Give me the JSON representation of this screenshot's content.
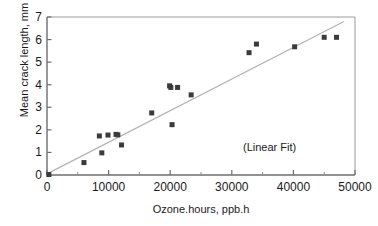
{
  "chart_data": {
    "type": "scatter",
    "title": "",
    "xlabel": "Ozone.hours, ppb.h",
    "ylabel": "Mean crack length, mm",
    "xlim": [
      0,
      50000
    ],
    "ylim": [
      0,
      7
    ],
    "xticks": [
      0,
      10000,
      20000,
      30000,
      40000,
      50000
    ],
    "xtick_labels": [
      "0",
      "10000",
      "20000",
      "30000",
      "40000",
      "50000"
    ],
    "xminor_ticks": [
      5000,
      15000,
      25000,
      35000,
      45000
    ],
    "yticks": [
      0,
      1,
      2,
      3,
      4,
      5,
      6,
      7
    ],
    "ytick_labels": [
      "0",
      "1",
      "2",
      "3",
      "4",
      "5",
      "6",
      "7"
    ],
    "grid": false,
    "legend": false,
    "annotations": [
      {
        "text": "(Linear Fit)",
        "x": 32000,
        "y": 1.35
      }
    ],
    "marker": {
      "shape": "square",
      "color": "#3b3b3b",
      "size": 5
    },
    "series": [
      {
        "name": "Mean crack length",
        "type": "scatter",
        "points": [
          {
            "x": 300,
            "y": 0.02
          },
          {
            "x": 6000,
            "y": 0.55
          },
          {
            "x": 8500,
            "y": 1.73
          },
          {
            "x": 8900,
            "y": 0.98
          },
          {
            "x": 9900,
            "y": 1.77
          },
          {
            "x": 11200,
            "y": 1.8
          },
          {
            "x": 11500,
            "y": 1.78
          },
          {
            "x": 12100,
            "y": 1.33
          },
          {
            "x": 17000,
            "y": 2.75
          },
          {
            "x": 19900,
            "y": 3.95
          },
          {
            "x": 20100,
            "y": 3.88
          },
          {
            "x": 20300,
            "y": 2.23
          },
          {
            "x": 21200,
            "y": 3.88
          },
          {
            "x": 23400,
            "y": 3.55
          },
          {
            "x": 32800,
            "y": 5.42
          },
          {
            "x": 34000,
            "y": 5.8
          },
          {
            "x": 40200,
            "y": 5.68
          },
          {
            "x": 45000,
            "y": 6.1
          },
          {
            "x": 47000,
            "y": 6.1
          }
        ]
      },
      {
        "name": "Linear Fit",
        "type": "line",
        "color": "#b3b3b3",
        "endpoints": [
          {
            "x": 0,
            "y": 0.05
          },
          {
            "x": 48200,
            "y": 6.8
          }
        ]
      }
    ]
  }
}
